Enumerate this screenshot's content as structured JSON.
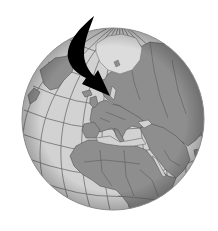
{
  "illustration": {
    "subject": "globe",
    "view": "orthographic, centered on Europe and Africa",
    "arrow": {
      "direction": "curved, pointing down-right",
      "target": "Scandinavia / Denmark"
    },
    "regions_visible": [
      "Arctic ice cap",
      "Greenland",
      "Europe",
      "Scandinavia",
      "Russia / Asia",
      "Middle East",
      "Africa",
      "Atlantic Ocean"
    ]
  },
  "colors": {
    "background": "#ffffff",
    "ocean": "#d2d2d2",
    "land": "#8e8e8e",
    "ice": "#dcdcdc",
    "graticule": "#6e6e6e",
    "border": "#555555",
    "arrow": "#000000",
    "limb_shadow": "#9a9a9a"
  },
  "globe": {
    "cx": 113,
    "cy": 119,
    "r": 91
  }
}
